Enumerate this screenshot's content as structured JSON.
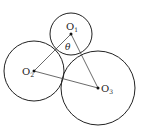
{
  "diagram": {
    "circles": [
      {
        "id": "O1",
        "label": "O",
        "sub": "1",
        "cx": 71,
        "cy": 34,
        "r": 21
      },
      {
        "id": "O2",
        "label": "O",
        "sub": "2",
        "cx": 34,
        "cy": 71,
        "r": 30
      },
      {
        "id": "O3",
        "label": "O",
        "sub": "3",
        "cx": 98,
        "cy": 88,
        "r": 37
      }
    ],
    "angle_label": "θ",
    "colors": {
      "stroke": "#222222",
      "line": "#444444"
    }
  }
}
